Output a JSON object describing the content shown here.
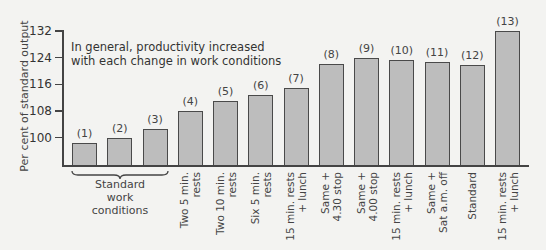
{
  "chart_data": {
    "type": "bar",
    "title": "",
    "annotation": "In general, productivity increased\nwith each change in work conditions",
    "ylabel": "Per cent of standard output",
    "xlabel": "",
    "ylim": [
      91.5,
      132
    ],
    "yticks": [
      100,
      108,
      116,
      124,
      132
    ],
    "grid": false,
    "categories": [
      "Standard work conditions (1)",
      "Standard work conditions (2)",
      "Standard work conditions (3)",
      "Two 5 min. rests",
      "Two 10 min. rests",
      "Six 5 min. rests",
      "15 min. rests + lunch",
      "Same + 4.30 stop",
      "Same + 4.00 stop",
      "15 min. rests + lunch",
      "Same + Sat a.m. off",
      "Standard",
      "15 min. rests + lunch"
    ],
    "bar_labels": [
      "(1)",
      "(2)",
      "(3)",
      "(4)",
      "(5)",
      "(6)",
      "(7)",
      "(8)",
      "(9)",
      "(10)",
      "(11)",
      "(12)",
      "(13)"
    ],
    "values": [
      98.3,
      100,
      102.6,
      108,
      111,
      112.8,
      115,
      122,
      123.8,
      123.2,
      122.7,
      121.9,
      132
    ],
    "group_label": "Standard work conditions",
    "group_spans": [
      1,
      3
    ],
    "x_tick_labels": [
      "",
      "",
      "",
      "Two 5 min.\nrests",
      "Two 10 min.\nrests",
      "Six 5 min.\nrests",
      "15 min. rests\n+ lunch",
      "Same +\n4.30 stop",
      "Same +\n4.00 stop",
      "15 min. rests\n+ lunch",
      "Same +\nSat a.m. off",
      "Standard",
      "15 min. rests\n+ lunch"
    ],
    "colors": {
      "bar_fill": "#bdbdbd",
      "bar_edge": "#4a4a4a",
      "background": "#f3f3f1"
    }
  }
}
